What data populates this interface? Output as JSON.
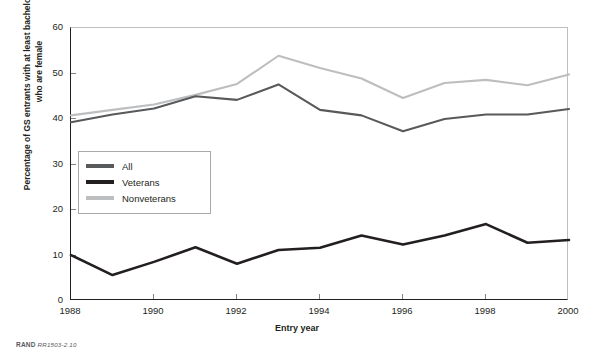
{
  "figure": {
    "credit_brand": "RAND",
    "credit_id": "RR1503-2.10"
  },
  "chart_data": {
    "type": "line",
    "title": "",
    "xlabel": "Entry year",
    "ylabel": "Percentage of GS entrants with at least bachelor's degrees who are female",
    "x": [
      1988,
      1989,
      1990,
      1991,
      1992,
      1993,
      1994,
      1995,
      1996,
      1997,
      1998,
      1999,
      2000
    ],
    "xlim": [
      1988,
      2000
    ],
    "ylim": [
      0,
      60
    ],
    "xticks": [
      1988,
      1990,
      1992,
      1994,
      1996,
      1998,
      2000
    ],
    "xtick_labels": [
      "1988",
      "1990",
      "1992",
      "1994",
      "1996",
      "1998",
      "2000"
    ],
    "yticks": [
      0,
      10,
      20,
      30,
      40,
      50,
      60
    ],
    "ytick_labels": [
      "0",
      "10",
      "20",
      "30",
      "40",
      "50",
      "60"
    ],
    "grid": false,
    "legend_position": "inside-left",
    "series": [
      {
        "name": "All",
        "color": "#58595b",
        "values": [
          39.3,
          41.0,
          42.3,
          45.0,
          44.2,
          47.6,
          42.0,
          40.8,
          37.3,
          40.0,
          41.0,
          41.0,
          42.2
        ]
      },
      {
        "name": "Veterans",
        "color": "#231f20",
        "values": [
          10.1,
          5.7,
          8.6,
          11.8,
          8.2,
          11.2,
          11.7,
          14.4,
          12.4,
          14.4,
          16.9,
          12.8,
          13.4
        ]
      },
      {
        "name": "Nonveterans",
        "color": "#bcbec0",
        "values": [
          40.8,
          42.0,
          43.2,
          45.3,
          47.7,
          53.9,
          51.2,
          48.9,
          44.6,
          47.9,
          48.6,
          47.4,
          49.8
        ]
      }
    ]
  }
}
